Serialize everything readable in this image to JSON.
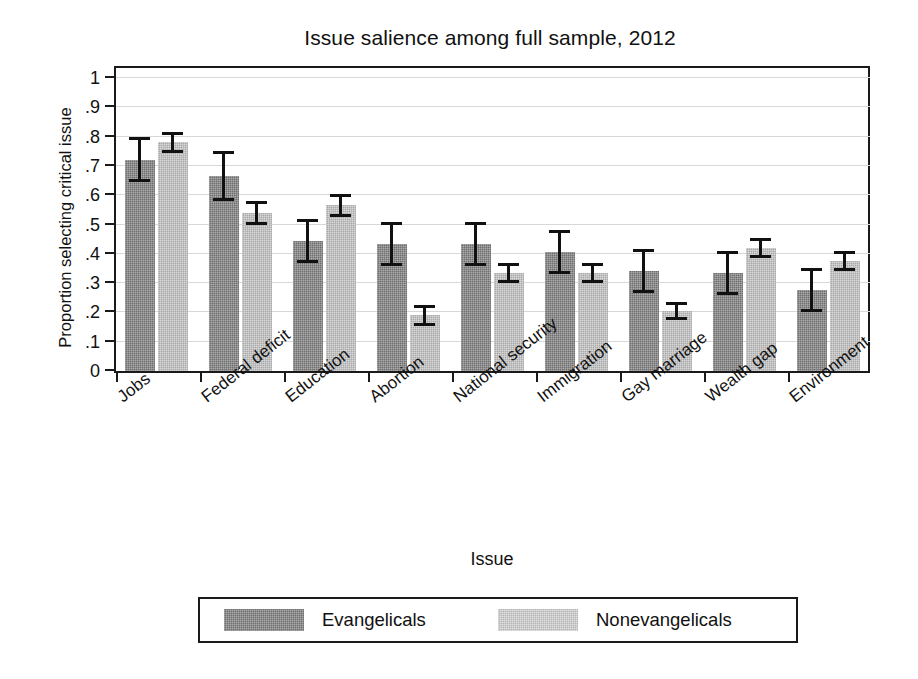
{
  "chart_data": {
    "type": "bar",
    "title": "Issue salience among full sample, 2012",
    "xlabel": "Issue",
    "ylabel": "Proportion selecting critical issue",
    "ylim": [
      0,
      1
    ],
    "yticks": [
      0,
      0.1,
      0.2,
      0.3,
      0.4,
      0.5,
      0.6,
      0.7,
      0.8,
      0.9,
      1
    ],
    "ytick_labels": [
      "0",
      ".1",
      ".2",
      ".3",
      ".4",
      ".5",
      ".6",
      ".7",
      ".8",
      ".9",
      "1"
    ],
    "grid": true,
    "grid_axis": "y",
    "legend_position": "below",
    "error_bars": "95% confidence interval",
    "categories": [
      "Jobs",
      "Federal deficit",
      "Education",
      "Abortion",
      "National security",
      "Immigration",
      "Gay marriage",
      "Wealth gap",
      "Environment"
    ],
    "series": [
      {
        "name": "Evangelicals",
        "color": "#6f6f6f",
        "values": [
          0.72,
          0.665,
          0.445,
          0.435,
          0.435,
          0.405,
          0.34,
          0.335,
          0.275
        ],
        "err_low": [
          0.65,
          0.585,
          0.375,
          0.365,
          0.365,
          0.335,
          0.27,
          0.265,
          0.205
        ],
        "err_high": [
          0.795,
          0.745,
          0.515,
          0.505,
          0.505,
          0.475,
          0.41,
          0.405,
          0.345
        ]
      },
      {
        "name": "Nonevangelicals",
        "color": "#a9a9a9",
        "values": [
          0.78,
          0.54,
          0.565,
          0.19,
          0.335,
          0.335,
          0.205,
          0.42,
          0.375
        ],
        "err_low": [
          0.75,
          0.505,
          0.53,
          0.16,
          0.305,
          0.305,
          0.18,
          0.39,
          0.345
        ],
        "err_high": [
          0.81,
          0.575,
          0.6,
          0.22,
          0.365,
          0.365,
          0.23,
          0.45,
          0.405
        ]
      }
    ]
  },
  "legend": {
    "entries": [
      {
        "label": "Evangelicals"
      },
      {
        "label": "Nonevangelicals"
      }
    ]
  }
}
